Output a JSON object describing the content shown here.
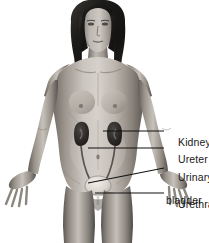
{
  "figure": {
    "background_color": "#ffffff",
    "width": 209,
    "height": 243,
    "style": "grayscale medical illustration"
  },
  "labels": [
    {
      "id": "kidney",
      "text": "Kidney",
      "text2": ""
    },
    {
      "id": "ureter",
      "text": "Ureter",
      "text2": ""
    },
    {
      "id": "bladder",
      "text": "Urinary",
      "text2": "bladder"
    },
    {
      "id": "urethra",
      "text": "Urethra",
      "text2": ""
    }
  ],
  "leader_lines": {
    "kidney": {
      "from_x": 103,
      "from_y": 131,
      "to_x": 164,
      "to_y": 131
    },
    "ureter": {
      "from_x": 88,
      "from_y": 148,
      "to_x": 164,
      "to_y": 148
    },
    "bladder": {
      "from_x": 88,
      "from_y": 183,
      "to_x": 164,
      "to_y": 168
    },
    "urethra": {
      "from_x": 95,
      "from_y": 193,
      "to_x": 164,
      "to_y": 193
    }
  },
  "colors": {
    "line": "#111111",
    "text": "#1a1a1a",
    "skin_light": "#d8d3ce",
    "skin_mid": "#9e9890",
    "skin_shadow": "#6d6862",
    "hair": "#1c1a19",
    "kidney": "#2e2b29",
    "bladder": "#e2ded7",
    "background": "#ffffff"
  },
  "organs": [
    {
      "name": "kidney-right",
      "label_ref": "kidney"
    },
    {
      "name": "kidney-left",
      "label_ref": "kidney"
    },
    {
      "name": "ureter-right",
      "label_ref": "ureter"
    },
    {
      "name": "ureter-left",
      "label_ref": "ureter"
    },
    {
      "name": "urinary-bladder",
      "label_ref": "bladder"
    },
    {
      "name": "urethra",
      "label_ref": "urethra"
    }
  ]
}
